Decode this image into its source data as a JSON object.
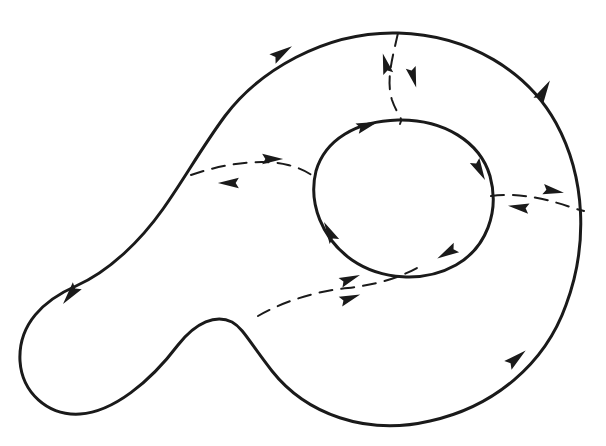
{
  "figure": {
    "background_color": "#ffffff",
    "ink_color": "#1a1a1a",
    "canvas": {
      "width": 606,
      "height": 446
    },
    "curve_stroke_width": 3.0,
    "dash_stroke_width": 2.0,
    "dash_pattern": "13 9"
  },
  "outer_boundary": {
    "name": "outer-boundary-curve",
    "description": "Large closed pear/kidney shaped outer contour",
    "path": "M 398 33 C 470 35 528 72 556 123 C 586 178 588 246 566 305 C 545 364 494 407 430 421 C 366 436 306 414 272 371 C 250 343 243 328 232 322 C 216 314 196 322 178 345 C 150 382 113 412 80 414 C 47 416 22 392 20 361 C 18 324 44 300 76 286 C 110 271 141 240 163 209 C 185 178 200 150 225 116 C 258 72 324 31 398 33 Z",
    "style": "solid",
    "orientation": "counterclockwise"
  },
  "inner_boundary": {
    "name": "inner-boundary-circle",
    "description": "Small closed circular inner contour (hole boundary)",
    "path": "M 398 120 C 444 119 480 142 490 176 C 500 212 486 248 456 265 C 424 283 381 280 352 260 C 322 239 308 203 316 171 C 325 140 356 121 398 120 Z",
    "style": "solid",
    "orientation": "clockwise"
  },
  "outer_arrows": [
    {
      "name": "arrow-outer-top-left",
      "x": 277,
      "y": 56,
      "angle": -33,
      "label": "up-right along upper-left arc"
    },
    {
      "name": "arrow-outer-top-right",
      "x": 541,
      "y": 96,
      "angle": -60,
      "label": "up-left along upper-right arc"
    },
    {
      "name": "arrow-outer-left",
      "x": 74,
      "y": 290,
      "angle": 128,
      "label": "down-left along left arc"
    },
    {
      "name": "arrow-outer-bottom",
      "x": 512,
      "y": 362,
      "angle": -40,
      "label": "up-right along lower-right arc"
    }
  ],
  "inner_arrows": [
    {
      "name": "arrow-inner-top",
      "x": 362,
      "y": 127,
      "angle": -18,
      "label": "right along top of circle"
    },
    {
      "name": "arrow-inner-right",
      "x": 477,
      "y": 165,
      "angle": 62,
      "label": "down-right along right of circle"
    },
    {
      "name": "arrow-inner-bottom-left",
      "x": 332,
      "y": 237,
      "angle": -118,
      "label": "up-left along lower-left of circle"
    },
    {
      "name": "arrow-inner-bottom-right",
      "x": 452,
      "y": 250,
      "angle": 150,
      "label": "down-left along lower-right of circle"
    }
  ],
  "flow_lines": [
    {
      "name": "flow-line-top",
      "description": "Dashed transversal from top of outer boundary down to top of inner circle",
      "path": "M 398 33 C 392 60 386 80 392 100 C 397 115 404 118 400 124",
      "arrows": [
        {
          "name": "arrow-flow-top-outward",
          "x": 387,
          "y": 69,
          "angle": -105,
          "label": "up-left toward outer boundary"
        },
        {
          "name": "arrow-flow-top-inward",
          "x": 412,
          "y": 72,
          "angle": 75,
          "label": "down-right toward inner circle"
        }
      ]
    },
    {
      "name": "flow-line-left",
      "description": "Dashed transversal from left of outer boundary to left of inner circle",
      "path": "M 191 175 C 228 162 266 159 288 165 C 304 169 310 174 316 178",
      "arrows": [
        {
          "name": "arrow-flow-left-right",
          "x": 267,
          "y": 159,
          "angle": 0,
          "label": "rightward toward inner circle"
        },
        {
          "name": "arrow-flow-left-left",
          "x": 234,
          "y": 183,
          "angle": 180,
          "label": "leftward toward outer boundary"
        }
      ]
    },
    {
      "name": "flow-line-right",
      "description": "Dashed transversal from right of inner circle to right of outer boundary",
      "path": "M 491 196 C 520 192 550 200 570 207 C 576 209 580 210 584 211",
      "arrows": [
        {
          "name": "arrow-flow-right-right",
          "x": 548,
          "y": 190,
          "angle": 10,
          "label": "rightward toward outer boundary"
        },
        {
          "name": "arrow-flow-right-left",
          "x": 524,
          "y": 208,
          "angle": 188,
          "label": "leftward toward inner circle"
        }
      ]
    },
    {
      "name": "flow-line-bottom",
      "description": "Dashed transversal from lower outer boundary up to bottom of inner circle",
      "path": "M 258 316 C 286 300 318 291 348 288 C 382 284 404 276 424 264",
      "arrows": [
        {
          "name": "arrow-flow-bottom-upper",
          "x": 345,
          "y": 281,
          "angle": -22,
          "label": "up-right toward inner circle"
        },
        {
          "name": "arrow-flow-bottom-lower",
          "x": 345,
          "y": 300,
          "angle": -20,
          "label": "up-right toward inner circle"
        }
      ]
    }
  ]
}
